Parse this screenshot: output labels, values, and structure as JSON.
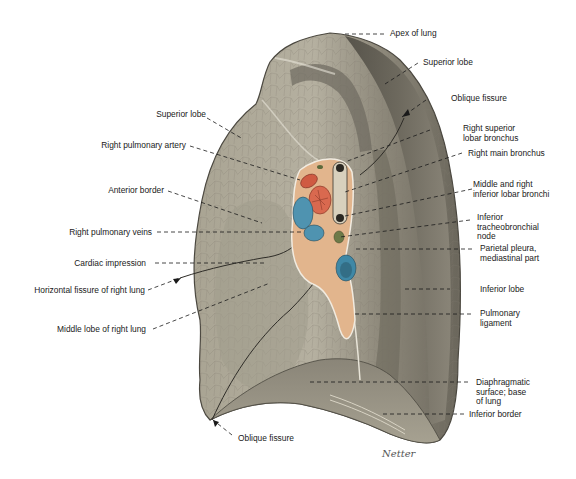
{
  "figure": {
    "colors": {
      "background": "#ffffff",
      "lung_light": "#b3ae9e",
      "lung_mid": "#8f8a7c",
      "lung_dark": "#5e5a50",
      "artery": "#d9694f",
      "vein": "#4f93b0",
      "bronchus": "#cfc6b2",
      "hilum_tissue": "#e2b58d",
      "node": "#6d7a48",
      "label_text": "#1a1a1a",
      "leader_line": "#1a1a1a"
    },
    "signature": "Netter"
  },
  "labels": {
    "right": [
      {
        "id": "apex",
        "text": "Apex of lung"
      },
      {
        "id": "superior-lobe-lateral",
        "text": "Superior lobe"
      },
      {
        "id": "oblique-fissure-top",
        "text": "Oblique fissure"
      },
      {
        "id": "right-superior-lobar-bronchus",
        "text": "Right superior\nlobar bronchus"
      },
      {
        "id": "right-main-bronchus",
        "text": "Right main bronchus"
      },
      {
        "id": "middle-inferior-lobar-bronchi",
        "text": "Middle and right\ninferior lobar bronchi"
      },
      {
        "id": "inferior-tracheobronchial-node",
        "text": "Inferior\ntracheobronchial\nnode"
      },
      {
        "id": "parietal-pleura",
        "text": "Parietal pleura,\nmediastinal part"
      },
      {
        "id": "inferior-lobe",
        "text": "Inferior lobe"
      },
      {
        "id": "pulmonary-ligament",
        "text": "Pulmonary\nligament"
      },
      {
        "id": "diaphragmatic-surface",
        "text": "Diaphragmatic\nsurface; base\nof lung"
      },
      {
        "id": "inferior-border",
        "text": "Inferior border"
      }
    ],
    "left": [
      {
        "id": "superior-lobe-medial",
        "text": "Superior lobe"
      },
      {
        "id": "right-pulmonary-artery",
        "text": "Right pulmonary artery"
      },
      {
        "id": "anterior-border",
        "text": "Anterior border"
      },
      {
        "id": "right-pulmonary-veins",
        "text": "Right pulmonary veins"
      },
      {
        "id": "cardiac-impression",
        "text": "Cardiac impression"
      },
      {
        "id": "horizontal-fissure",
        "text": "Horizontal fissure of right lung"
      },
      {
        "id": "middle-lobe",
        "text": "Middle lobe of right lung"
      }
    ],
    "bottom": [
      {
        "id": "oblique-fissure-bottom",
        "text": "Oblique fissure"
      }
    ]
  }
}
